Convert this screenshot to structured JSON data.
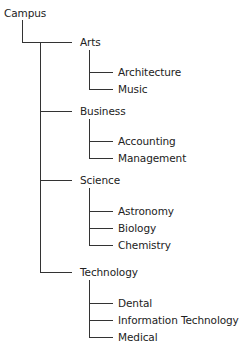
{
  "tree": {
    "root": "Campus",
    "branches": [
      {
        "label": "Arts",
        "children": [
          "Architecture",
          "Music"
        ]
      },
      {
        "label": "Business",
        "children": [
          "Accounting",
          "Management"
        ]
      },
      {
        "label": "Science",
        "children": [
          "Astronomy",
          "Biology",
          "Chemistry"
        ]
      },
      {
        "label": "Technology",
        "children": [
          "Dental",
          "Information Technology",
          "Medical"
        ]
      }
    ]
  },
  "colors": {
    "line": "#333333",
    "text": "#222222",
    "background": "#ffffff"
  }
}
